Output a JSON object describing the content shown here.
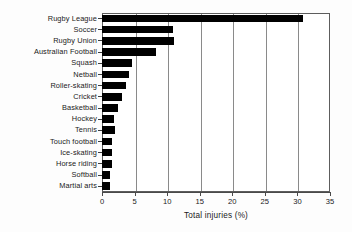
{
  "chart_data": {
    "type": "bar",
    "orientation": "horizontal",
    "title": "",
    "xlabel": "Total injuries (%)",
    "ylabel": "",
    "xlim": [
      0,
      35
    ],
    "xticks": [
      0,
      5,
      10,
      15,
      20,
      25,
      30,
      35
    ],
    "grid": "vertical gridlines at each x tick",
    "legend": "none",
    "bar_color": "#000000",
    "categories": [
      "Rugby League",
      "Soccer",
      "Rugby Union",
      "Australian Football",
      "Squash",
      "Netball",
      "Roller-skating",
      "Cricket",
      "Basketball",
      "Hockey",
      "Tennis",
      "Touch football",
      "Ice-skating",
      "Horse riding",
      "Softball",
      "Martial arts"
    ],
    "values": [
      30.8,
      10.9,
      11.1,
      8.3,
      4.6,
      4.1,
      3.7,
      3.0,
      2.5,
      1.8,
      2.0,
      1.5,
      1.5,
      1.5,
      1.2,
      1.3
    ]
  }
}
